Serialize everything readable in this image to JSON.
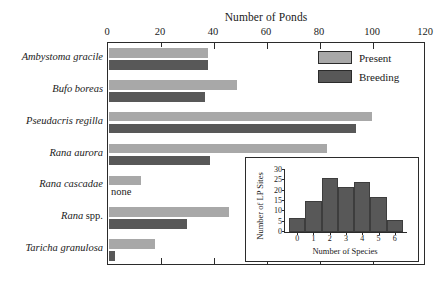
{
  "chart_data": [
    {
      "id": "main",
      "type": "bar",
      "orientation": "horizontal",
      "title": "",
      "xlabel": "Number of Ponds",
      "ylabel": "",
      "xlim": [
        0,
        120
      ],
      "xticks": [
        0,
        20,
        40,
        60,
        80,
        100,
        120
      ],
      "xtick_labels": [
        "0",
        "20",
        "40",
        "60",
        "80",
        "100",
        "120"
      ],
      "grid": false,
      "axis_position": "top",
      "legend": [
        "Present",
        "Breeding"
      ],
      "legend_position": "top-right-inside",
      "categories": [
        "Ambystoma gracile",
        "Bufo boreas",
        "Pseudacris regilla",
        "Rana aurora",
        "Rana cascadae",
        "Rana spp.",
        "Taricha granulosa"
      ],
      "series": [
        {
          "name": "Present",
          "color": "#a8a8a8",
          "values": [
            38,
            49,
            100,
            83,
            13,
            46,
            18
          ]
        },
        {
          "name": "Breeding",
          "color": "#585858",
          "values": [
            38,
            37,
            94,
            39,
            0,
            30,
            3
          ]
        }
      ],
      "annotations": [
        {
          "text": "none",
          "category": "Rana cascadae",
          "series": "Breeding"
        }
      ]
    },
    {
      "id": "inset",
      "type": "bar",
      "orientation": "vertical",
      "title": "",
      "xlabel": "Number of Species",
      "ylabel": "Number of LP Sites",
      "ylim": [
        0,
        30
      ],
      "yticks": [
        0,
        5,
        10,
        15,
        20,
        25,
        30
      ],
      "ytick_labels": [
        "0",
        "5",
        "10",
        "15",
        "20",
        "25",
        "30"
      ],
      "xticks": [
        0,
        1,
        2,
        3,
        4,
        5,
        6
      ],
      "xtick_labels": [
        "0",
        "1",
        "2",
        "3",
        "4",
        "5",
        "6"
      ],
      "grid": false,
      "categories": [
        "0",
        "1",
        "2",
        "3",
        "4",
        "5",
        "6"
      ],
      "values": [
        7,
        15,
        26,
        22,
        24,
        17,
        6
      ],
      "bar_color": "#585858"
    }
  ],
  "main": {
    "axis_title": "Number of Ponds",
    "xtick_labels": [
      "0",
      "20",
      "40",
      "60",
      "80",
      "100",
      "120"
    ],
    "species": [
      {
        "name_italic": "Ambystoma gracile",
        "name_plain": ""
      },
      {
        "name_italic": "Bufo boreas",
        "name_plain": ""
      },
      {
        "name_italic": "Pseudacris regilla",
        "name_plain": ""
      },
      {
        "name_italic": "Rana aurora",
        "name_plain": ""
      },
      {
        "name_italic": "Rana cascadae",
        "name_plain": ""
      },
      {
        "name_italic": "Rana",
        "name_plain": " spp."
      },
      {
        "name_italic": "Taricha granulosa",
        "name_plain": ""
      }
    ],
    "none_label": "none"
  },
  "legend": {
    "present_label": "Present",
    "breeding_label": "Breeding",
    "present_color": "#a8a8a8",
    "breeding_color": "#585858"
  },
  "inset": {
    "xlabel": "Number of Species",
    "ylabel": "Number of LP Sites",
    "ytick_labels": [
      "0",
      "5",
      "10",
      "15",
      "20",
      "25",
      "30"
    ],
    "xtick_labels": [
      "0",
      "1",
      "2",
      "3",
      "4",
      "5",
      "6"
    ]
  }
}
